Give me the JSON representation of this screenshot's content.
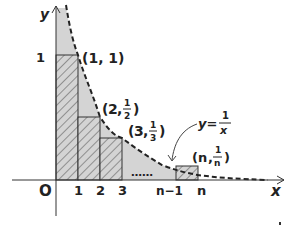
{
  "diagram": {
    "type": "riemann-sum-diagram",
    "curve": {
      "equation_label": "y = 1/x",
      "label_prefix": "y=",
      "label_numerator": "1",
      "label_denominator": "x",
      "style": "dashed"
    },
    "axes": {
      "x_label": "x",
      "y_label": "y",
      "origin_label": "O"
    },
    "x_ticks": [
      "1",
      "2",
      "3",
      "n−1",
      "n"
    ],
    "y_ticks": [
      "1"
    ],
    "ellipsis": "……",
    "points": [
      {
        "label": "(1, 1)",
        "x": "1",
        "y": "1"
      },
      {
        "label": "(2, 1/2)",
        "x": "2",
        "y_num": "1",
        "y_den": "2"
      },
      {
        "label": "(3, 1/3)",
        "x": "3",
        "y_num": "1",
        "y_den": "3"
      },
      {
        "label": "(n, 1/n)",
        "x": "n",
        "y_num": "1",
        "y_den": "n"
      }
    ],
    "colors": {
      "shaded_area": "#d4d4d4",
      "hatch": "#555555",
      "lines": "#222222"
    }
  }
}
